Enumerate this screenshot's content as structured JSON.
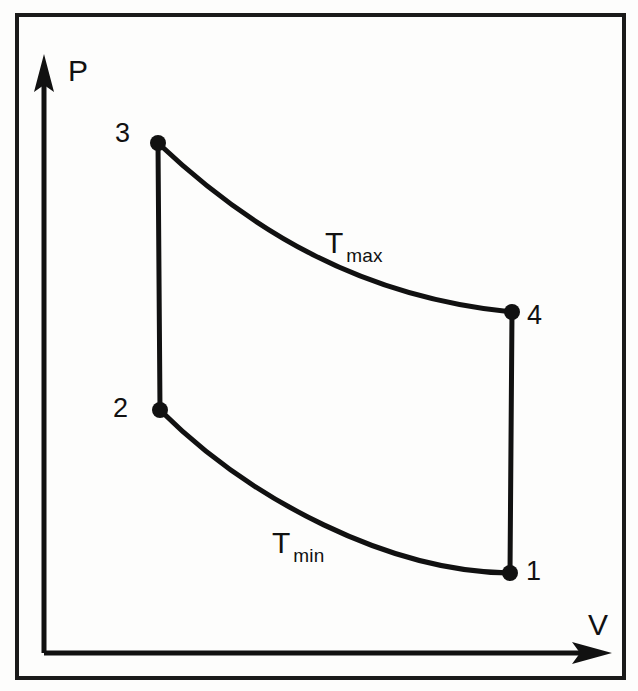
{
  "figure": {
    "kind": "pressure-volume-diagram",
    "border_color": "#1a1a1a",
    "line_color": "#111111",
    "background": "#fdfdfc"
  },
  "axes": {
    "y_label": "P",
    "x_label": "V",
    "origin_px": [
      44,
      653
    ],
    "y_axis_tip_px": [
      44,
      57
    ],
    "x_axis_tip_px": [
      610,
      653
    ],
    "ticks": [],
    "gridlines": false
  },
  "labels": {
    "point_1": "1",
    "point_2": "2",
    "point_3": "3",
    "point_4": "4",
    "isotherm_hot_base": "T",
    "isotherm_hot_sub": "max",
    "isotherm_cold_base": "T",
    "isotherm_cold_sub": "min"
  },
  "chart_data": {
    "type": "line",
    "title": "",
    "xlabel": "V",
    "ylabel": "P",
    "xlim": [
      0,
      1
    ],
    "ylim": [
      0,
      1
    ],
    "grid": false,
    "legend_position": "inline-annotation",
    "annotations": [
      {
        "text": "T max",
        "px": [
          335,
          245
        ],
        "describes": "upper isotherm 3 to 4"
      },
      {
        "text": "T min",
        "px": [
          283,
          545
        ],
        "describes": "lower isotherm 2 to 1"
      }
    ],
    "points": [
      {
        "name": "1",
        "px": [
          510,
          573
        ],
        "label_side": "right"
      },
      {
        "name": "2",
        "px": [
          160,
          410
        ],
        "label_side": "left"
      },
      {
        "name": "3",
        "px": [
          158,
          143
        ],
        "label_side": "left"
      },
      {
        "name": "4",
        "px": [
          512,
          312
        ],
        "label_side": "right"
      }
    ],
    "series": [
      {
        "name": "isochoric-compression-heating-2-to-3",
        "kind": "straight",
        "path": "M 160 410 L 158 143"
      },
      {
        "name": "isothermal-expansion-Tmax-3-to-4",
        "kind": "curve",
        "path": "M 158 143 C 250 230, 360 297, 512 312"
      },
      {
        "name": "isochoric-cooling-4-to-1",
        "kind": "straight",
        "path": "M 512 312 L 510 573"
      },
      {
        "name": "isothermal-compression-Tmin-1-to-2",
        "kind": "curve",
        "path": "M 510 573 C 390 572, 250 500, 160 410"
      }
    ]
  }
}
